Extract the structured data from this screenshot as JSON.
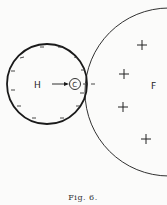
{
  "figure": {
    "caption": "Fig. 6.",
    "caption_display": "Fig. 6.",
    "labels": {
      "left_circle": "H",
      "contact_point": "C",
      "right_region": "F"
    },
    "charges": {
      "left_circle_sign": "−",
      "right_region_sign": "+",
      "outside_contact_sign": "−"
    },
    "colors": {
      "background": "#fbfbfa",
      "stroke": "#1a1a1a"
    }
  }
}
